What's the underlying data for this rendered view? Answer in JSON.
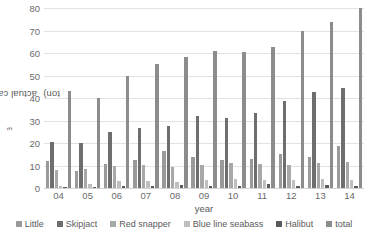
{
  "chart_data": {
    "type": "bar",
    "title": "",
    "subtitle": "",
    "xlabel": "year",
    "ylabel": "actual catch (x10³ ton)",
    "ylabel_prefix": "actual catch (x10",
    "ylabel_exponent": "3",
    "ylabel_suffix": " ton)",
    "ylim": [
      0,
      80
    ],
    "ytick_values": [
      0,
      10,
      20,
      30,
      40,
      50,
      60,
      70,
      80
    ],
    "ytick_labels": [
      "0",
      "10",
      "20",
      "30",
      "40",
      "50",
      "60",
      "70",
      "80"
    ],
    "grid": true,
    "legend_position": "bottom",
    "categories": [
      "04",
      "05",
      "06",
      "07",
      "08",
      "09",
      "10",
      "11",
      "12",
      "13",
      "14"
    ],
    "series": [
      {
        "name": "Little",
        "color": "#9a9a9a",
        "values": [
          11.8,
          7.7,
          10.6,
          12.6,
          16.6,
          13.7,
          12.6,
          12.9,
          15.2,
          13.6,
          18.6
        ]
      },
      {
        "name": "Skipjact",
        "color": "#6e6e6e",
        "values": [
          20.6,
          19.9,
          25.0,
          26.8,
          27.4,
          31.8,
          31.2,
          33.5,
          38.8,
          42.5,
          44.5
        ]
      },
      {
        "name": "Red snapper",
        "color": "#a8a8a8",
        "values": [
          8.2,
          8.6,
          9.6,
          10.3,
          9.5,
          10.3,
          10.9,
          10.5,
          10.4,
          10.9,
          11.5
        ]
      },
      {
        "name": "Blue line seabass",
        "color": "#bfbfbf",
        "values": [
          1.0,
          2.0,
          2.9,
          3.3,
          2.5,
          3.4,
          3.9,
          3.6,
          3.7,
          3.9,
          3.5
        ]
      },
      {
        "name": "Halibut",
        "color": "#5a5a5a",
        "values": [
          0.6,
          0.6,
          0.7,
          0.7,
          1.3,
          1.0,
          0.9,
          1.6,
          1.1,
          1.4,
          1.1
        ]
      },
      {
        "name": "total",
        "color": "#8c8c8c",
        "values": [
          43.0,
          40.1,
          49.6,
          55.0,
          58.3,
          61.0,
          60.6,
          62.8,
          70.0,
          74.0,
          80.0
        ]
      }
    ]
  }
}
